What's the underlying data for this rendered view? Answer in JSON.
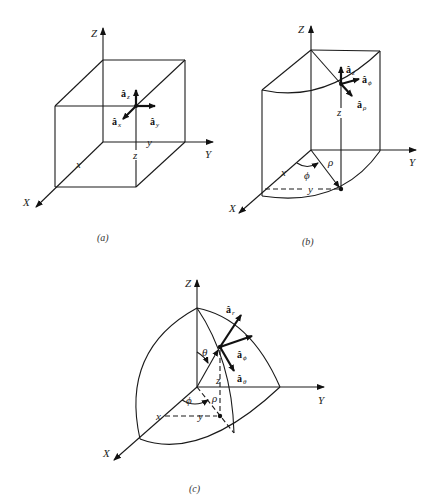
{
  "figure": {
    "panels": [
      {
        "id": "a",
        "caption": "(a)",
        "system": "rectangular",
        "axes": {
          "x": "X",
          "y": "Y",
          "z": "Z"
        },
        "coord_labels": {
          "x": "x",
          "y": "y",
          "z": "z"
        },
        "unit_vectors": [
          {
            "symbol": "â",
            "sub": "z"
          },
          {
            "symbol": "â",
            "sub": "x"
          },
          {
            "symbol": "â",
            "sub": "y"
          }
        ]
      },
      {
        "id": "b",
        "caption": "(b)",
        "system": "cylindrical",
        "axes": {
          "x": "X",
          "y": "Y",
          "z": "Z"
        },
        "coord_labels": {
          "x": "x",
          "y": "y",
          "z": "z",
          "rho": "ρ",
          "phi": "ϕ"
        },
        "unit_vectors": [
          {
            "symbol": "â",
            "sub": "z"
          },
          {
            "symbol": "â",
            "sub": "ϕ"
          },
          {
            "symbol": "â",
            "sub": "ρ"
          }
        ]
      },
      {
        "id": "c",
        "caption": "(c)",
        "system": "spherical",
        "axes": {
          "x": "X",
          "y": "Y",
          "z": "Z"
        },
        "coord_labels": {
          "x": "x",
          "y": "y",
          "z": "z",
          "rho": "ρ",
          "phi": "ϕ",
          "theta": "θ"
        },
        "unit_vectors": [
          {
            "symbol": "â",
            "sub": "r"
          },
          {
            "symbol": "â",
            "sub": "ϕ"
          },
          {
            "symbol": "â",
            "sub": "θ"
          }
        ]
      }
    ]
  }
}
